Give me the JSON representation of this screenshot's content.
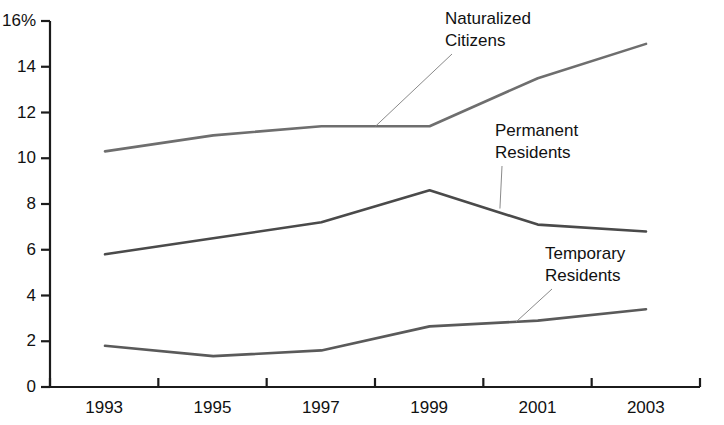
{
  "chart_data": {
    "type": "line",
    "title": "",
    "subtitle": "",
    "xlabel": "",
    "ylabel": "",
    "x": [
      1993,
      1995,
      1997,
      1999,
      2001,
      2003
    ],
    "categories": [
      "1993",
      "1995",
      "1997",
      "1999",
      "2001",
      "2003"
    ],
    "xlim": [
      1993,
      2003
    ],
    "ylim": [
      0,
      16
    ],
    "yticks": [
      0,
      2,
      4,
      6,
      8,
      10,
      12,
      14,
      16
    ],
    "ytick_labels": [
      "0",
      "2",
      "4",
      "6",
      "8",
      "10",
      "12",
      "14",
      "16%"
    ],
    "xtick_labels": [
      "1993",
      "1995",
      "1997",
      "1999",
      "2001",
      "2003"
    ],
    "grid": false,
    "legend_position": "inline-annotations",
    "series": [
      {
        "name": "Naturalized Citizens",
        "values": [
          10.3,
          11.0,
          11.4,
          11.4,
          13.5,
          15.0
        ],
        "color": "#6e6e6e"
      },
      {
        "name": "Permanent Residents",
        "values": [
          5.8,
          6.5,
          7.2,
          8.6,
          7.1,
          6.8
        ],
        "color": "#4a4a4a"
      },
      {
        "name": "Temporary Residents",
        "values": [
          1.8,
          1.35,
          1.6,
          2.65,
          2.9,
          3.4
        ],
        "color": "#5a5a5a"
      }
    ],
    "annotations": [
      {
        "id": "naturalized-citizens",
        "line1": "Naturalized",
        "line2": "Citizens",
        "anchor_x": 1998.0,
        "anchor_y": 11.4
      },
      {
        "id": "permanent-residents",
        "line1": "Permanent",
        "line2": "Residents",
        "anchor_x": 2000.3,
        "anchor_y": 7.8
      },
      {
        "id": "temporary-residents",
        "line1": "Temporary",
        "line2": "Residents",
        "anchor_x": 2000.6,
        "anchor_y": 2.85
      }
    ],
    "axis_color": "#1b1b1b",
    "text_color": "#111111"
  }
}
